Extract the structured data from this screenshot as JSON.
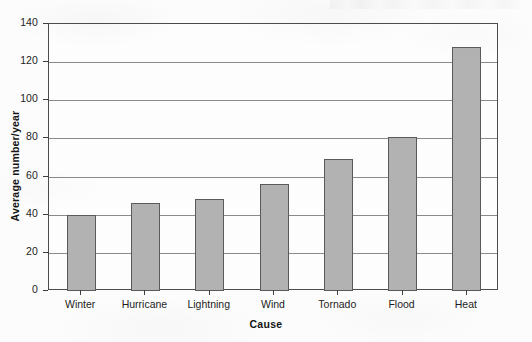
{
  "chart_data": {
    "type": "bar",
    "title": "",
    "xlabel": "Cause",
    "ylabel": "Average number/year",
    "categories": [
      "Winter",
      "Hurricane",
      "Lightning",
      "Wind",
      "Tornado",
      "Flood",
      "Heat"
    ],
    "values": [
      40,
      46,
      48,
      56,
      69,
      81,
      128
    ],
    "ylim": [
      0,
      140
    ],
    "ytick_labels": [
      "0",
      "20",
      "40",
      "60",
      "80",
      "100",
      "120",
      "140"
    ],
    "ytick_values": [
      0,
      20,
      40,
      60,
      80,
      100,
      120,
      140
    ],
    "grid": true,
    "legend": null,
    "bar_fill_color": "#b2b2b2",
    "bar_border_color": "#5a5a5a",
    "axis_color": "#4c4c4c",
    "gridline_color": "#8a8a8a"
  }
}
